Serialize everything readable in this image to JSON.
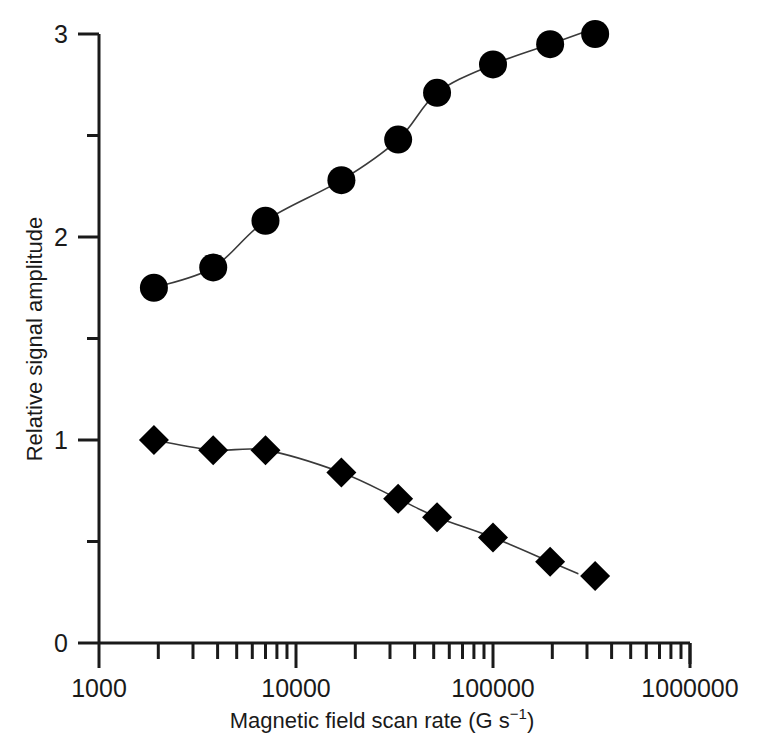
{
  "chart_data": {
    "type": "scatter",
    "title": "",
    "xlabel": "Magnetic field scan rate (G s−1)",
    "xlabel_base": "Magnetic field scan rate (G s",
    "xlabel_sup": "−1",
    "xlabel_tail": ")",
    "ylabel": "Relative signal amplitude",
    "xscale": "log",
    "yscale": "linear",
    "xlim": [
      1000,
      1000000
    ],
    "ylim": [
      0,
      3
    ],
    "grid": false,
    "legend": "none",
    "xticks": [
      1000,
      10000,
      100000,
      1000000
    ],
    "xtick_labels": [
      "1000",
      "10000",
      "100000",
      "1000000"
    ],
    "yticks": [
      0,
      1,
      2,
      3
    ],
    "ytick_labels": [
      "0",
      "1",
      "2",
      "3"
    ],
    "yminor_ticks": [
      0.5,
      1.5,
      2.5
    ],
    "series": [
      {
        "name": "circles",
        "marker": "circle",
        "color": "#000000",
        "x": [
          1900,
          3800,
          7000,
          17000,
          33000,
          52000,
          100000,
          195000,
          330000
        ],
        "y": [
          1.75,
          1.85,
          2.08,
          2.28,
          2.48,
          2.71,
          2.85,
          2.95,
          3.0
        ]
      },
      {
        "name": "diamonds",
        "marker": "diamond",
        "color": "#000000",
        "x": [
          1900,
          3800,
          7000,
          17000,
          33000,
          52000,
          100000,
          195000,
          330000
        ],
        "y": [
          1.0,
          0.95,
          0.95,
          0.84,
          0.71,
          0.62,
          0.52,
          0.4,
          0.33
        ]
      }
    ]
  }
}
